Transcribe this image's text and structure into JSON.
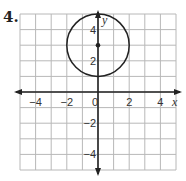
{
  "problem_number": "4.",
  "chart_data": {
    "type": "scatter",
    "title": "",
    "xlabel": "x",
    "ylabel": "y",
    "xlim": [
      -5,
      5
    ],
    "ylim": [
      -5,
      5
    ],
    "grid": true,
    "grid_step": 1,
    "x_tick_labels": [
      {
        "value": -4,
        "label": "−4"
      },
      {
        "value": -2,
        "label": "−2"
      },
      {
        "value": 0,
        "label": "0"
      },
      {
        "value": 2,
        "label": "2"
      },
      {
        "value": 4,
        "label": "4"
      }
    ],
    "y_tick_labels": [
      {
        "value": 4,
        "label": "4"
      },
      {
        "value": 2,
        "label": "2"
      },
      {
        "value": -2,
        "label": "−2"
      },
      {
        "value": -4,
        "label": "−4"
      }
    ],
    "shapes": [
      {
        "kind": "circle",
        "center": [
          0,
          3
        ],
        "radius": 2
      }
    ],
    "points": [
      {
        "x": 0,
        "y": 3,
        "label": "center"
      }
    ],
    "colors": {
      "grid": "#b8b8b8",
      "axis": "#222222",
      "circle": "#222222"
    }
  }
}
